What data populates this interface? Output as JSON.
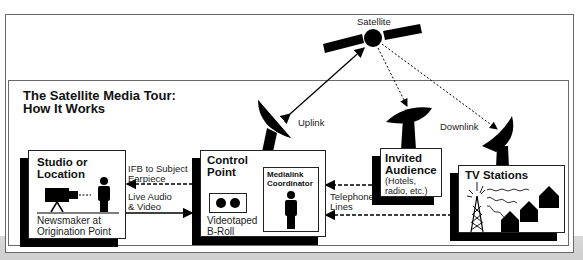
{
  "diagram": {
    "title_line1": "The Satellite Media Tour:",
    "title_line2": "How It Works",
    "satellite_label": "Satellite",
    "uplink_label": "Uplink",
    "downlink_label": "Downlink",
    "nodes": {
      "studio": {
        "title_line1": "Studio or",
        "title_line2": "Location",
        "caption_line1": "Newsmaker at",
        "caption_line2": "Origination Point"
      },
      "control": {
        "title_line1": "Control",
        "title_line2": "Point",
        "broll_line1": "Videotaped",
        "broll_line2": "B-Roll",
        "coordinator_line1": "Medialink",
        "coordinator_line2": "Coordinator"
      },
      "audience": {
        "title_line1": "Invited",
        "title_line2": "Audience",
        "sub_line1": "(Hotels,",
        "sub_line2": "radio, etc.)"
      },
      "tv": {
        "title": "TV Stations"
      }
    },
    "links": {
      "ifb_line1": "IFB to Subject",
      "ifb_line2": "Earpiece",
      "live_line1": "Live Audio",
      "live_line2": "& Video",
      "phone_line1": "Telephone",
      "phone_line2": "Lines"
    },
    "colors": {
      "ink": "#000000",
      "frame": "#6a6a6a",
      "paper": "#ffffff",
      "shadow_bg": "#d4d4d4"
    }
  }
}
